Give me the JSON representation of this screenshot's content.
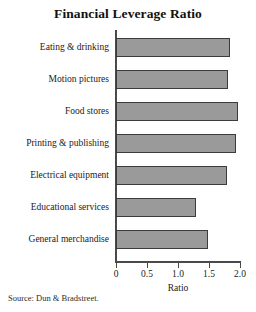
{
  "chart_data": {
    "type": "bar",
    "orientation": "horizontal",
    "title": "Financial Leverage Ratio",
    "xlabel": "Ratio",
    "ylabel": "",
    "xlim": [
      0,
      2.0
    ],
    "grid": false,
    "legend": null,
    "source": "Source: Dun & Bradstreet.",
    "xticks": [
      {
        "value": 0,
        "label": "0"
      },
      {
        "value": 0.5,
        "label": "0.5"
      },
      {
        "value": 1.0,
        "label": "1.0"
      },
      {
        "value": 1.5,
        "label": "1.5"
      },
      {
        "value": 2.0,
        "label": "2.0"
      }
    ],
    "categories": [
      "Eating & drinking",
      "Motion pictures",
      "Food stores",
      "Printing & publishing",
      "Electrical equipment",
      "Educational services",
      "General merchandise"
    ],
    "values": [
      1.84,
      1.8,
      1.97,
      1.93,
      1.79,
      1.29,
      1.48
    ],
    "bar_color": "#9a9a9a",
    "bar_border_color": "#3c3c3c",
    "axis_color": "#4a4a4a"
  }
}
